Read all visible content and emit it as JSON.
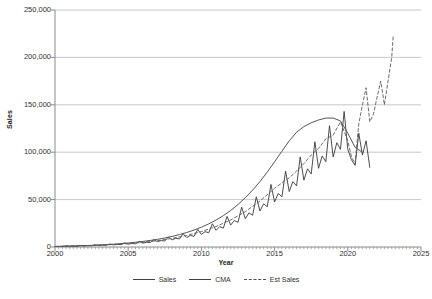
{
  "chart_data": {
    "type": "line",
    "title": "",
    "xlabel": "Year",
    "ylabel": "Sales",
    "xlim": [
      2000,
      2025
    ],
    "ylim": [
      0,
      250000
    ],
    "grid": true,
    "legend_position": "bottom",
    "y_ticks": [
      0,
      50000,
      100000,
      150000,
      200000,
      250000
    ],
    "y_tick_labels": [
      "0",
      "50,000",
      "100,000",
      "150,000",
      "200,000",
      "250,000"
    ],
    "x_ticks": [
      2000,
      2005,
      2010,
      2015,
      2020,
      2025
    ],
    "x_tick_labels": [
      "2000",
      "2005",
      "2010",
      "2015",
      "2020",
      "2025"
    ],
    "series": [
      {
        "name": "Sales",
        "style": "solid",
        "color": "#3a3a3a",
        "x": [
          2000.0,
          2000.25,
          2000.5,
          2000.75,
          2001.0,
          2001.25,
          2001.5,
          2001.75,
          2002.0,
          2002.25,
          2002.5,
          2002.75,
          2003.0,
          2003.25,
          2003.5,
          2003.75,
          2004.0,
          2004.25,
          2004.5,
          2004.75,
          2005.0,
          2005.25,
          2005.5,
          2005.75,
          2006.0,
          2006.25,
          2006.5,
          2006.75,
          2007.0,
          2007.25,
          2007.5,
          2007.75,
          2008.0,
          2008.25,
          2008.5,
          2008.75,
          2009.0,
          2009.25,
          2009.5,
          2009.75,
          2010.0,
          2010.25,
          2010.5,
          2010.75,
          2011.0,
          2011.25,
          2011.5,
          2011.75,
          2012.0,
          2012.25,
          2012.5,
          2012.75,
          2013.0,
          2013.25,
          2013.5,
          2013.75,
          2014.0,
          2014.25,
          2014.5,
          2014.75,
          2015.0,
          2015.25,
          2015.5,
          2015.75,
          2016.0,
          2016.25,
          2016.5,
          2016.75,
          2017.0,
          2017.25,
          2017.5,
          2017.75,
          2018.0,
          2018.25,
          2018.5,
          2018.75,
          2019.0,
          2019.25,
          2019.5,
          2019.75,
          2020.0,
          2020.25,
          2020.5,
          2020.75,
          2021.0,
          2021.25,
          2021.5
        ],
        "values": [
          500,
          700,
          600,
          1200,
          800,
          1000,
          900,
          1700,
          1100,
          1400,
          1300,
          2300,
          1600,
          2000,
          1800,
          3100,
          2200,
          2700,
          2500,
          4300,
          3000,
          3700,
          3400,
          5800,
          4100,
          5000,
          4600,
          7800,
          5600,
          6800,
          6300,
          10500,
          7500,
          9200,
          8500,
          14000,
          10000,
          12200,
          11300,
          18500,
          13300,
          16200,
          15000,
          24500,
          17600,
          21500,
          19900,
          32300,
          23100,
          28000,
          26000,
          42000,
          29800,
          36000,
          33500,
          53000,
          38000,
          45500,
          42500,
          66000,
          47500,
          56500,
          53000,
          80000,
          58500,
          69000,
          64500,
          95000,
          70500,
          82500,
          77000,
          111000,
          83000,
          96000,
          90000,
          128000,
          95000,
          110000,
          103000,
          143000,
          103000,
          92000,
          86000,
          120000,
          97000,
          112000,
          84000
        ]
      },
      {
        "name": "CMA",
        "style": "solid",
        "color": "#555555",
        "x": [
          2000.5,
          2001.0,
          2001.5,
          2002.0,
          2002.5,
          2003.0,
          2003.5,
          2004.0,
          2004.5,
          2005.0,
          2005.5,
          2006.0,
          2006.5,
          2007.0,
          2007.5,
          2008.0,
          2008.5,
          2009.0,
          2009.5,
          2010.0,
          2010.5,
          2011.0,
          2011.5,
          2012.0,
          2012.5,
          2013.0,
          2013.5,
          2014.0,
          2014.5,
          2015.0,
          2015.5,
          2016.0,
          2016.5,
          2017.0,
          2017.5,
          2018.0,
          2018.5,
          2019.0,
          2019.5,
          2020.0,
          2020.5,
          2021.0
        ],
        "values": [
          750,
          950,
          1150,
          1450,
          1750,
          2100,
          2550,
          3000,
          3600,
          4200,
          5000,
          5900,
          6900,
          8100,
          9500,
          11200,
          13100,
          15300,
          17900,
          20900,
          24400,
          28400,
          33100,
          38500,
          44800,
          52000,
          60000,
          69000,
          79000,
          90000,
          101000,
          112000,
          121000,
          127000,
          131000,
          134000,
          136000,
          136000,
          133000,
          120000,
          105000,
          100000
        ]
      },
      {
        "name": "Est Sales",
        "style": "dashed",
        "color": "#5a5a5a",
        "x": [
          2000.0,
          2001.0,
          2002.0,
          2003.0,
          2004.0,
          2005.0,
          2006.0,
          2007.0,
          2008.0,
          2009.0,
          2010.0,
          2011.0,
          2012.0,
          2013.0,
          2014.0,
          2015.0,
          2016.0,
          2016.5,
          2017.0,
          2017.5,
          2018.0,
          2018.5,
          2019.0,
          2019.5,
          2020.0,
          2020.25,
          2020.5,
          2020.75,
          2021.0,
          2021.25,
          2021.5,
          2021.75,
          2022.0,
          2022.25,
          2022.5,
          2022.75,
          2023.0,
          2023.1
        ],
        "values": [
          600,
          950,
          1350,
          1900,
          2600,
          3600,
          4900,
          6700,
          9100,
          12200,
          16300,
          21600,
          28500,
          37300,
          48500,
          62000,
          73000,
          80000,
          88000,
          97000,
          104000,
          114000,
          118000,
          132000,
          112000,
          95000,
          88000,
          130000,
          150000,
          168000,
          132000,
          140000,
          158000,
          175000,
          150000,
          175000,
          200000,
          222000
        ]
      }
    ],
    "annotations": []
  },
  "legend": {
    "items": [
      {
        "label": "Sales",
        "style": "solid"
      },
      {
        "label": "CMA",
        "style": "solid"
      },
      {
        "label": "Est Sales",
        "style": "dashed"
      }
    ]
  }
}
